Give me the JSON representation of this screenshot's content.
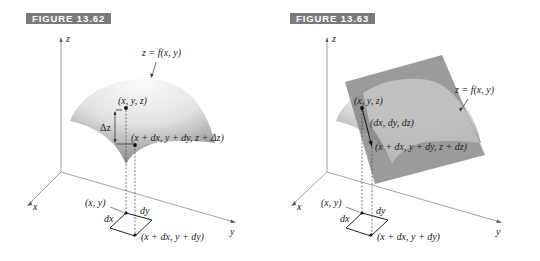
{
  "figures": [
    {
      "label": "FIGURE 13.62",
      "axes": {
        "z": "z",
        "x": "x",
        "y": "y"
      },
      "surface_label": "z = f(x, y)",
      "points": {
        "top": "(x, y, z)",
        "bottom": "(x + dx, y + dy, z + Δz)",
        "base_corner": "(x, y)",
        "base_opposite": "(x + dx, y + dy)"
      },
      "increment_label": "Δz",
      "base_sides": {
        "dx": "dx",
        "dy": "dy"
      }
    },
    {
      "label": "FIGURE 13.63",
      "axes": {
        "z": "z",
        "x": "x",
        "y": "y"
      },
      "surface_label": "z = f(x, y)",
      "points": {
        "top": "(x, y, z)",
        "bottom": "(x + dx, y + dy, z + dz)",
        "base_corner": "(x, y)",
        "base_opposite": "(x + dx, y + dy)"
      },
      "vector_label": "(dx, dy, dz)",
      "base_sides": {
        "dx": "dx",
        "dy": "dy"
      }
    }
  ],
  "colors": {
    "label_bg": "#7a7a7a",
    "axis": "#888888",
    "surface_light": "#f2f2f2",
    "surface_dark": "#9a9a9a",
    "tangent_plane": "#8a8a8a"
  }
}
